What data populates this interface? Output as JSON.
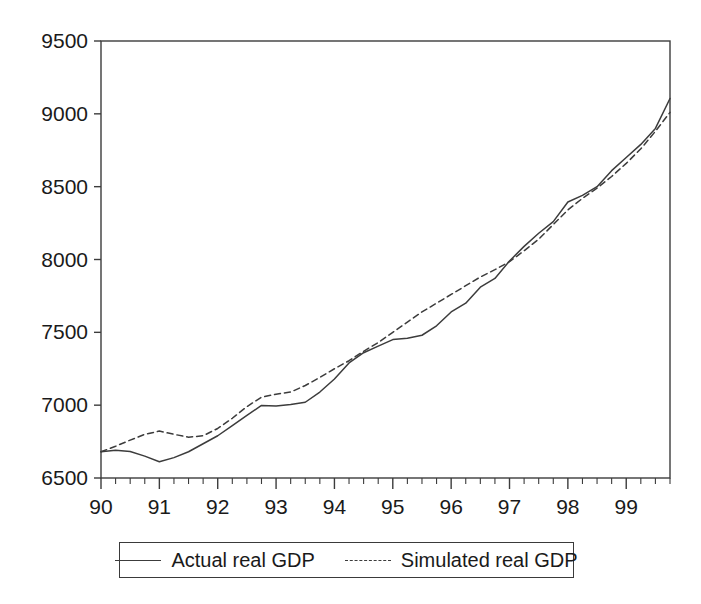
{
  "chart_data": {
    "type": "line",
    "title": "",
    "xlabel": "",
    "ylabel": "",
    "xlim": [
      1990.0,
      1999.75
    ],
    "ylim": [
      6500,
      9500
    ],
    "grid": false,
    "legend_position": "below-center",
    "y_ticks": [
      6500,
      7000,
      7500,
      8000,
      8500,
      9000,
      9500
    ],
    "y_tick_labels": [
      "6500",
      "7000",
      "7500",
      "8000",
      "8500",
      "9000",
      "9500"
    ],
    "x_ticks": [
      1990,
      1991,
      1992,
      1993,
      1994,
      1995,
      1996,
      1997,
      1998,
      1999
    ],
    "x_tick_labels": [
      "90",
      "91",
      "92",
      "93",
      "94",
      "95",
      "96",
      "97",
      "98",
      "99"
    ],
    "x_minor_ticks_per_year": 4,
    "x": [
      1990.0,
      1990.25,
      1990.5,
      1990.75,
      1991.0,
      1991.25,
      1991.5,
      1991.75,
      1992.0,
      1992.25,
      1992.5,
      1992.75,
      1993.0,
      1993.25,
      1993.5,
      1993.75,
      1994.0,
      1994.25,
      1994.5,
      1994.75,
      1995.0,
      1995.25,
      1995.5,
      1995.75,
      1996.0,
      1996.25,
      1996.5,
      1996.75,
      1997.0,
      1997.25,
      1997.5,
      1997.75,
      1998.0,
      1998.25,
      1998.5,
      1998.75,
      1999.0,
      1999.25,
      1999.5,
      1999.75
    ],
    "series": [
      {
        "name": "Actual real GDP",
        "style": "solid",
        "color": "#3c3c3c",
        "values": [
          6680,
          6690,
          6682,
          6650,
          6612,
          6640,
          6680,
          6735,
          6790,
          6860,
          6930,
          6998,
          6995,
          7005,
          7020,
          7090,
          7180,
          7290,
          7360,
          7405,
          7450,
          7460,
          7480,
          7545,
          7640,
          7700,
          7810,
          7870,
          7990,
          8090,
          8180,
          8260,
          8395,
          8440,
          8500,
          8610,
          8700,
          8790,
          8900,
          9105
        ]
      },
      {
        "name": "Simulated real GDP",
        "style": "dashed",
        "color": "#3c3c3c",
        "values": [
          6680,
          6718,
          6760,
          6800,
          6822,
          6800,
          6780,
          6790,
          6840,
          6910,
          6990,
          7055,
          7075,
          7090,
          7135,
          7190,
          7250,
          7305,
          7370,
          7430,
          7500,
          7570,
          7640,
          7700,
          7760,
          7820,
          7880,
          7930,
          7985,
          8060,
          8140,
          8240,
          8340,
          8420,
          8490,
          8570,
          8660,
          8760,
          8880,
          9010
        ]
      }
    ]
  },
  "legend": {
    "entries": [
      {
        "label": "Actual real GDP",
        "style": "solid"
      },
      {
        "label": "Simulated real GDP",
        "style": "dashed"
      }
    ]
  },
  "axes": {
    "frame_color": "#3c3c3c"
  }
}
